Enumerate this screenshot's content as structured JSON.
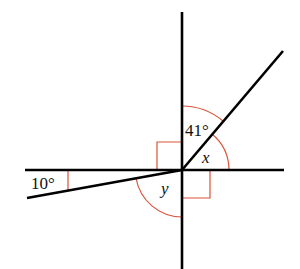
{
  "diagram": {
    "type": "angle-diagram",
    "colors": {
      "line": "#000000",
      "marker": "#d9533a",
      "background": "#ffffff"
    },
    "labels": {
      "angle_top": "41°",
      "angle_x": "x",
      "angle_y": "y",
      "angle_left": "10°"
    },
    "elements": [
      {
        "name": "vertical-line",
        "kind": "line"
      },
      {
        "name": "horizontal-line",
        "kind": "line"
      },
      {
        "name": "diagonal-up-right",
        "kind": "ray"
      },
      {
        "name": "ray-down-left",
        "kind": "ray"
      },
      {
        "name": "right-angle-upper-left",
        "kind": "right-angle-marker"
      },
      {
        "name": "right-angle-lower-right",
        "kind": "right-angle-marker"
      }
    ]
  }
}
